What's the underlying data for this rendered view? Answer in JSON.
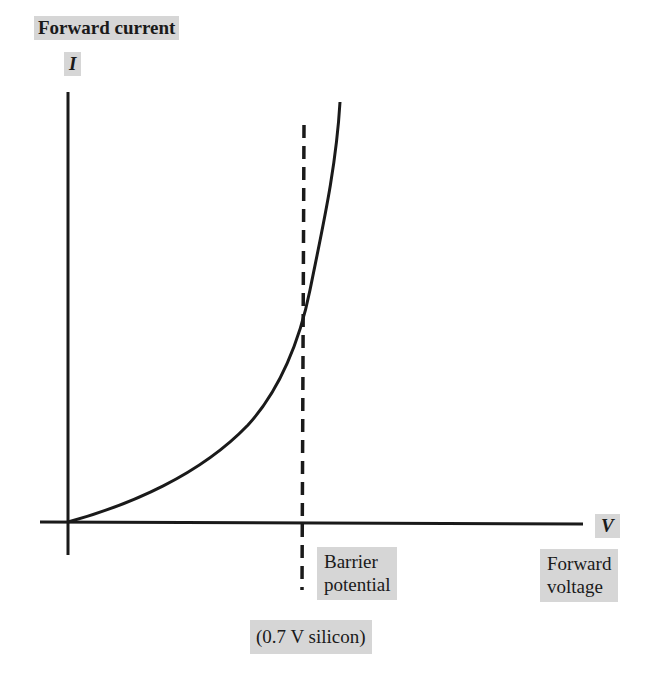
{
  "labels": {
    "y_axis_title": "Forward current",
    "y_axis_symbol": "I",
    "x_axis_symbol": "V",
    "x_axis_title_line1": "Forward",
    "x_axis_title_line2": "voltage",
    "barrier_line1": "Barrier",
    "barrier_line2": "potential",
    "barrier_value": "(0.7 V silicon)"
  },
  "curve": {
    "description": "Diode forward I-V characteristic, exponential rise",
    "barrier_potential_v": 0.7,
    "material": "silicon"
  },
  "colors": {
    "label_background": "#d6d6d6",
    "line": "#1a1a1a"
  }
}
